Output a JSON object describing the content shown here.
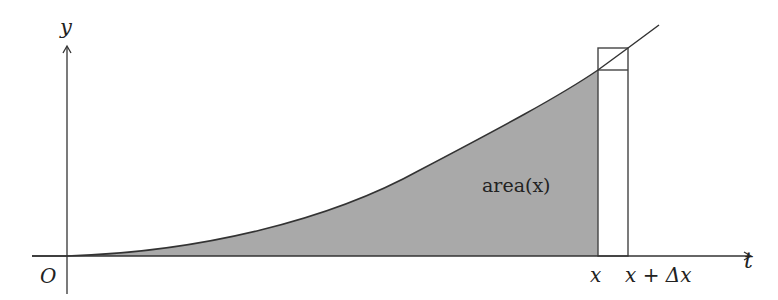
{
  "diagram": {
    "axes": {
      "x_label": "t",
      "y_label": "y",
      "origin_label": "O"
    },
    "region_label": "area(x)",
    "tick_labels": {
      "x": "x",
      "x_plus_dx": "x + Δx"
    },
    "colors": {
      "fill": "#a9a9a9",
      "stroke": "#333333",
      "background": "#ffffff"
    }
  }
}
